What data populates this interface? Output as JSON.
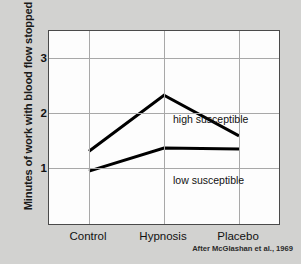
{
  "chart_data": {
    "type": "line",
    "title": "",
    "xlabel": "",
    "ylabel": "Minutes of work with blood flow stopped",
    "categories": [
      "Control",
      "Hypnosis",
      "Placebo"
    ],
    "yticks": [
      1,
      2,
      3
    ],
    "ylim": [
      0,
      3.55
    ],
    "grid": "both",
    "legend_position": "inline-right",
    "series": [
      {
        "name": "high susceptible",
        "values": [
          1.36,
          2.38,
          1.64
        ]
      },
      {
        "name": "low susceptible",
        "values": [
          1.0,
          1.42,
          1.4
        ]
      }
    ],
    "annotations": {
      "caption": "After McGlashan et al., 1969"
    },
    "colors": {
      "line": "#000000",
      "plot_background": "#fdfdfd",
      "page_background": "#d2d2d0",
      "grid": "#a8a8a8",
      "axis": "#4a4a4a"
    }
  },
  "labels": {
    "ytick_1": "1",
    "ytick_2": "2",
    "ytick_3": "3",
    "xtick_control": "Control",
    "xtick_hypnosis": "Hypnosis",
    "xtick_placebo": "Placebo",
    "series_high": "high susceptible",
    "series_low": "low susceptible",
    "y_axis_title": "Minutes of work with blood flow stopped",
    "caption": "After McGlashan et al., 1969"
  }
}
